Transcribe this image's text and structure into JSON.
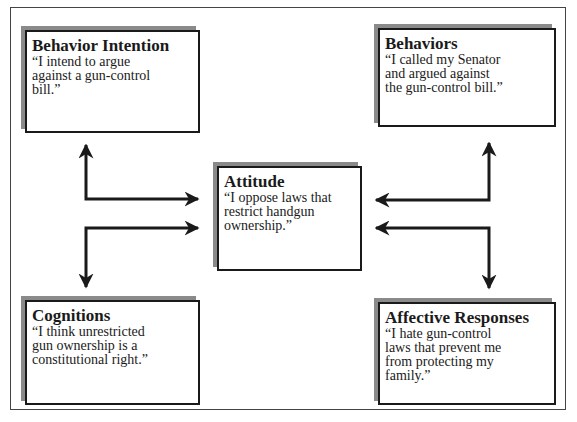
{
  "diagram": {
    "center": {
      "title": "Attitude",
      "quote": "“I oppose laws that\nrestrict handgun\nownership.”"
    },
    "nodes": {
      "behavior_intention": {
        "title": "Behavior Intention",
        "quote": "“I intend to argue\nagainst a gun-control\nbill.”"
      },
      "behaviors": {
        "title": "Behaviors",
        "quote": "“I called my Senator\nand argued against\nthe gun-control bill.”"
      },
      "cognitions": {
        "title": "Cognitions",
        "quote": "“I think unrestricted\ngun ownership is a\nconstitutional right.”"
      },
      "affective_responses": {
        "title": "Affective Responses",
        "quote": "“I hate gun-control\nlaws that prevent me\nfrom protecting my\nfamily.”"
      }
    },
    "edges": [
      {
        "from": "attitude",
        "to": "behavior_intention",
        "bidirectional": true
      },
      {
        "from": "attitude",
        "to": "cognitions",
        "bidirectional": true
      },
      {
        "from": "attitude",
        "to": "behaviors",
        "bidirectional": true
      },
      {
        "from": "attitude",
        "to": "affective_responses",
        "bidirectional": true
      }
    ],
    "colors": {
      "stroke": "#1a1a1a",
      "shadow": "#8a8a8a",
      "background": "#ffffff"
    }
  }
}
